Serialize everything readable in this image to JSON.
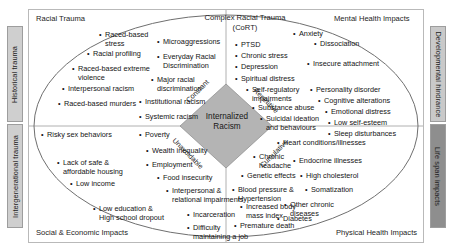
{
  "diagram": {
    "center": {
      "label": "Internalized\nRacism",
      "descriptors": {
        "top_left": "Constant",
        "top_right": "Repetitive",
        "bottom_left": "Unavoidable",
        "bottom_right": "Cumulative"
      }
    },
    "corner_titles": {
      "top_left": "Racial Trauma",
      "top_center": "Complex Racial Trauma\n(CoRT)",
      "top_right": "Mental Health Impacts",
      "bottom_left": "Social & Economic Impacts",
      "bottom_right": "Physical Health Impacts"
    },
    "side_bars": {
      "left_top": "Historical trauma",
      "left_bottom": "Intergenerational trauma",
      "right_top": "Developmental hindrance",
      "right_bottom": "Life span impacts"
    },
    "quadrants": {
      "racial_trauma": [
        "Raced-based\nstress",
        "Racial profiling",
        "Raced-based extreme\nviolence",
        "Interpersonal racism",
        "Raced-based murders",
        "Microaggressions",
        "Everyday Racial\nDiscrimination",
        "Major racial\ndiscrimination",
        "Institutional racism",
        "Systemic racism"
      ],
      "mental_health": [
        "Anxiety",
        "Dissociation",
        "PTSD",
        "Chronic stress",
        "Depression",
        "Spiritual distress",
        "Insecure attachment",
        "Self-regulatory\nimpairments",
        "Personality disorder",
        "Cognitive alterations",
        "Substance abuse",
        "Emotional distress",
        "Suicidal ideation\nand behaviours",
        "Low self-esteem",
        "Sleep disturbances"
      ],
      "social_economic": [
        "Risky sex behaviors",
        "Poverty",
        "Wealth inequality",
        "Lack of safe &\naffordable housing",
        "Employment",
        "Food insecurity",
        "Low income",
        "Interpersonal &\nrelational impairments",
        "Low education &\nHigh school dropout",
        "Incarceration",
        "Difficulty\nmaintaining a job"
      ],
      "physical_health": [
        "Heart conditions/illnesses",
        "Chronic\nheadache",
        "Endocrine illnesses",
        "Genetic effects",
        "High cholesterol",
        "Blood pressure &\nHypertension",
        "Somatization",
        "Increased body\nmass index",
        "Other chronic\ndiseases",
        "Diabetes",
        "Premature death"
      ]
    },
    "colors": {
      "frame_border": "#b9b9b9",
      "bar_light": "#cfcfcf",
      "bar_dark": "#8e8e8e",
      "diamond_fill": "#b4b4b4",
      "ellipse_stroke": "#6f6f6f"
    }
  }
}
